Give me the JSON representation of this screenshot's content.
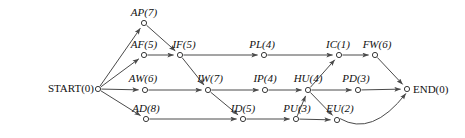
{
  "diagram": {
    "type": "activity-on-node-network",
    "nodes": [
      {
        "id": "START",
        "label": "START(0)",
        "name": "START",
        "duration": 0,
        "x": 98,
        "y": 89,
        "label_x": 94,
        "label_y": 92,
        "anchor": "end",
        "italic": false
      },
      {
        "id": "AP",
        "label": "AP(7)",
        "name": "AP",
        "duration": 7,
        "x": 144,
        "y": 23,
        "label_x": 144,
        "label_y": 16,
        "anchor": "middle",
        "italic": true
      },
      {
        "id": "AF",
        "label": "AF(5)",
        "name": "AF",
        "duration": 5,
        "x": 144,
        "y": 55,
        "label_x": 144,
        "label_y": 48,
        "anchor": "middle",
        "italic": true
      },
      {
        "id": "IF",
        "label": "IF(5)",
        "name": "IF",
        "duration": 5,
        "x": 180,
        "y": 55,
        "label_x": 184,
        "label_y": 48,
        "anchor": "middle",
        "italic": true
      },
      {
        "id": "PL",
        "label": "PL(4)",
        "name": "PL",
        "duration": 4,
        "x": 264,
        "y": 55,
        "label_x": 262,
        "label_y": 48,
        "anchor": "middle",
        "italic": true
      },
      {
        "id": "IC",
        "label": "IC(1)",
        "name": "IC",
        "duration": 1,
        "x": 339,
        "y": 55,
        "label_x": 338,
        "label_y": 48,
        "anchor": "middle",
        "italic": true
      },
      {
        "id": "FW",
        "label": "FW(6)",
        "name": "FW",
        "duration": 6,
        "x": 375,
        "y": 55,
        "label_x": 377,
        "label_y": 48,
        "anchor": "middle",
        "italic": true
      },
      {
        "id": "AW",
        "label": "AW(6)",
        "name": "AW",
        "duration": 6,
        "x": 145,
        "y": 90,
        "label_x": 143,
        "label_y": 82,
        "anchor": "middle",
        "italic": true
      },
      {
        "id": "IW",
        "label": "IW(7)",
        "name": "IW",
        "duration": 7,
        "x": 208,
        "y": 90,
        "label_x": 210,
        "label_y": 82,
        "anchor": "middle",
        "italic": true
      },
      {
        "id": "IP",
        "label": "IP(4)",
        "name": "IP",
        "duration": 4,
        "x": 265,
        "y": 90,
        "label_x": 265,
        "label_y": 82,
        "anchor": "middle",
        "italic": true
      },
      {
        "id": "HU",
        "label": "HU(4)",
        "name": "HU",
        "duration": 4,
        "x": 308,
        "y": 90,
        "label_x": 308,
        "label_y": 82,
        "anchor": "middle",
        "italic": true
      },
      {
        "id": "PD",
        "label": "PD(3)",
        "name": "PD",
        "duration": 3,
        "x": 358,
        "y": 90,
        "label_x": 356,
        "label_y": 82,
        "anchor": "middle",
        "italic": true
      },
      {
        "id": "END",
        "label": "END(0)",
        "name": "END",
        "duration": 0,
        "x": 407,
        "y": 89,
        "label_x": 413,
        "label_y": 93,
        "anchor": "start",
        "italic": false
      },
      {
        "id": "AD",
        "label": "AD(8)",
        "name": "AD",
        "duration": 8,
        "x": 146,
        "y": 119,
        "label_x": 146,
        "label_y": 112,
        "anchor": "middle",
        "italic": true
      },
      {
        "id": "ID",
        "label": "ID(5)",
        "name": "ID",
        "duration": 5,
        "x": 243,
        "y": 119,
        "label_x": 243,
        "label_y": 112,
        "anchor": "middle",
        "italic": true
      },
      {
        "id": "PU",
        "label": "PU(3)",
        "name": "PU",
        "duration": 3,
        "x": 296,
        "y": 119,
        "label_x": 297,
        "label_y": 112,
        "anchor": "middle",
        "italic": true
      },
      {
        "id": "EU",
        "label": "EU(2)",
        "name": "EU",
        "duration": 2,
        "x": 337,
        "y": 120,
        "label_x": 340,
        "label_y": 112,
        "anchor": "middle",
        "italic": true
      }
    ],
    "edges": [
      {
        "from": "START",
        "to": "AP",
        "curved": false
      },
      {
        "from": "START",
        "to": "AF",
        "curved": false
      },
      {
        "from": "START",
        "to": "AW",
        "curved": false
      },
      {
        "from": "START",
        "to": "AD",
        "curved": false
      },
      {
        "from": "AP",
        "to": "IF",
        "curved": false
      },
      {
        "from": "AF",
        "to": "IF",
        "curved": false
      },
      {
        "from": "IF",
        "to": "PL",
        "curved": false
      },
      {
        "from": "IF",
        "to": "IW",
        "curved": false
      },
      {
        "from": "PL",
        "to": "IC",
        "curved": false
      },
      {
        "from": "IC",
        "to": "FW",
        "curved": false
      },
      {
        "from": "FW",
        "to": "END",
        "curved": false
      },
      {
        "from": "AW",
        "to": "IW",
        "curved": false
      },
      {
        "from": "IW",
        "to": "IP",
        "curved": false
      },
      {
        "from": "IW",
        "to": "ID",
        "curved": false
      },
      {
        "from": "IP",
        "to": "HU",
        "curved": false
      },
      {
        "from": "HU",
        "to": "PD",
        "curved": false
      },
      {
        "from": "HU",
        "to": "IC",
        "curved": false
      },
      {
        "from": "HU",
        "to": "EU",
        "curved": false
      },
      {
        "from": "PD",
        "to": "END",
        "curved": false
      },
      {
        "from": "AD",
        "to": "ID",
        "curved": false
      },
      {
        "from": "ID",
        "to": "PU",
        "curved": false
      },
      {
        "from": "PU",
        "to": "EU",
        "curved": false
      },
      {
        "from": "PU",
        "to": "HU",
        "curved": false
      },
      {
        "from": "EU",
        "to": "END",
        "curved": true
      }
    ],
    "colors": {
      "edge": "#4a4a4a",
      "node_stroke": "#3a3a3a",
      "node_fill": "#ffffff",
      "text": "#111111",
      "background": "#ffffff"
    }
  }
}
